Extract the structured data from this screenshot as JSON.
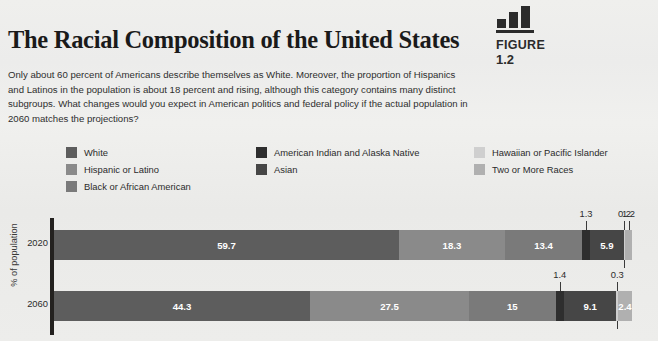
{
  "figure": {
    "icon": "bar-chart-icon",
    "label": "FIGURE",
    "number": "1.2"
  },
  "title": "The Racial Composition of the United States",
  "blurb": "Only about 60 percent of Americans describe themselves as White. Moreover, the proportion of Hispanics and Latinos in the population is about 18 percent and rising, although this category contains many distinct subgroups. What changes would you expect in American politics and federal policy if the actual population in 2060 matches the projections?",
  "legend": {
    "columns": [
      {
        "items": [
          {
            "label": "White",
            "color": "#5d5d5d"
          },
          {
            "label": "Hispanic or Latino",
            "color": "#8a8a8a"
          },
          {
            "label": "Black or African American",
            "color": "#7a7a7a"
          }
        ]
      },
      {
        "items": [
          {
            "label": "American Indian and Alaska Native",
            "color": "#2e2e2e"
          },
          {
            "label": "Asian",
            "color": "#464646"
          }
        ]
      },
      {
        "items": [
          {
            "label": "Hawaiian or Pacific Islander",
            "color": "#cfcfcf"
          },
          {
            "label": "Two or More Races",
            "color": "#b0b0b0"
          }
        ]
      }
    ]
  },
  "chart_data": {
    "type": "bar",
    "orientation": "horizontal",
    "stacked": true,
    "title": "The Racial Composition of the United States",
    "xlabel": "",
    "ylabel": "% of population",
    "categories": [
      "2020",
      "2060"
    ],
    "grid": false,
    "legend_position": "top",
    "xlim": [
      0,
      100
    ],
    "series": [
      {
        "name": "White",
        "color": "#5d5d5d",
        "values": [
          59.7,
          44.3
        ]
      },
      {
        "name": "Hispanic or Latino",
        "color": "#8a8a8a",
        "values": [
          18.3,
          27.5
        ]
      },
      {
        "name": "Black or African American",
        "color": "#7a7a7a",
        "values": [
          13.4,
          15
        ]
      },
      {
        "name": "American Indian and Alaska Native",
        "color": "#2e2e2e",
        "values": [
          1.3,
          1.4
        ]
      },
      {
        "name": "Asian",
        "color": "#464646",
        "values": [
          5.9,
          9.1
        ]
      },
      {
        "name": "Hawaiian or Pacific Islander",
        "color": "#cfcfcf",
        "values": [
          0.2,
          0.3
        ]
      },
      {
        "name": "Two or More Races",
        "color": "#b0b0b0",
        "values": [
          1.2,
          2.4
        ]
      }
    ]
  },
  "rows": [
    {
      "tick": "2020",
      "segments": [
        {
          "name": "White",
          "value": "59.7",
          "pct": 59.7,
          "color": "#5d5d5d",
          "inside": true
        },
        {
          "name": "Hispanic or Latino",
          "value": "18.3",
          "pct": 18.3,
          "color": "#8a8a8a",
          "inside": true
        },
        {
          "name": "Black or African American",
          "value": "13.4",
          "pct": 13.4,
          "color": "#7a7a7a",
          "inside": true
        },
        {
          "name": "American Indian and Alaska Native",
          "value": "1.3",
          "pct": 1.3,
          "color": "#2e2e2e",
          "inside": false
        },
        {
          "name": "Asian",
          "value": "5.9",
          "pct": 5.9,
          "color": "#464646",
          "inside": true
        },
        {
          "name": "Hawaiian or Pacific Islander",
          "value": "0.2",
          "pct": 0.2,
          "color": "#cfcfcf",
          "inside": false
        },
        {
          "name": "Two or More Races",
          "value": "1.2",
          "pct": 1.2,
          "color": "#b0b0b0",
          "inside": false
        }
      ]
    },
    {
      "tick": "2060",
      "segments": [
        {
          "name": "White",
          "value": "44.3",
          "pct": 44.3,
          "color": "#5d5d5d",
          "inside": true
        },
        {
          "name": "Hispanic or Latino",
          "value": "27.5",
          "pct": 27.5,
          "color": "#8a8a8a",
          "inside": true
        },
        {
          "name": "Black or African American",
          "value": "15",
          "pct": 15,
          "color": "#7a7a7a",
          "inside": true
        },
        {
          "name": "American Indian and Alaska Native",
          "value": "1.4",
          "pct": 1.4,
          "color": "#2e2e2e",
          "inside": false
        },
        {
          "name": "Asian",
          "value": "9.1",
          "pct": 9.1,
          "color": "#464646",
          "inside": true
        },
        {
          "name": "Hawaiian or Pacific Islander",
          "value": "0.3",
          "pct": 0.3,
          "color": "#cfcfcf",
          "inside": false
        },
        {
          "name": "Two or More Races",
          "value": "2.4",
          "pct": 2.4,
          "color": "#b0b0b0",
          "inside": true
        }
      ]
    }
  ],
  "axis": {
    "y_title": "% of population"
  }
}
